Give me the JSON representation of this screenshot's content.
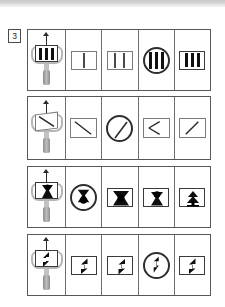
{
  "page": {
    "background_color": "#ffffff",
    "top_bar_color": "#d4d4d4",
    "ink_color": "#2a2a2c",
    "roller_color": "#b6b6b8"
  },
  "question": {
    "number": "3",
    "type": "visual-analogy-matrix",
    "row_count": 4,
    "cells_per_row": 5
  },
  "rows": [
    {
      "id": "row-1",
      "name": "vertical-bars-row",
      "stamp": {
        "name": "stamp-tool",
        "arrow": "up-arrow",
        "plate_glyph": "rect-with-3-vertical-bars",
        "bar_count": 3
      },
      "options": [
        {
          "label": "A",
          "glyph": "rect-with-1-vertical-bar",
          "shape": "rect",
          "bar_count": 1,
          "weight": "thin"
        },
        {
          "label": "B",
          "glyph": "rect-with-2-vertical-bars",
          "shape": "rect",
          "bar_count": 2,
          "weight": "thin"
        },
        {
          "label": "C",
          "glyph": "circle-with-3-vertical-bars",
          "shape": "circle",
          "bar_count": 3,
          "weight": "bold"
        },
        {
          "label": "D",
          "glyph": "rect-with-3-vertical-bars",
          "shape": "rect",
          "bar_count": 3,
          "weight": "bold"
        }
      ]
    },
    {
      "id": "row-2",
      "name": "diagonal-line-row",
      "stamp": {
        "name": "stamp-tool",
        "arrow": "up-arrow",
        "plate_glyph": "rect-with-backslash-diagonal",
        "diagonal": "backslash"
      },
      "options": [
        {
          "label": "A",
          "glyph": "rect-with-backslash-diagonal",
          "shape": "rect",
          "diagonal": "backslash"
        },
        {
          "label": "B",
          "glyph": "circle-with-slash-diagonal",
          "shape": "circle",
          "diagonal": "slash"
        },
        {
          "label": "C",
          "glyph": "rect-with-left-chevron",
          "shape": "rect",
          "diagonal": "chevron-left"
        },
        {
          "label": "D",
          "glyph": "rect-with-slash-diagonal",
          "shape": "rect",
          "diagonal": "slash"
        }
      ]
    },
    {
      "id": "row-3",
      "name": "hourglass-row",
      "stamp": {
        "name": "stamp-tool",
        "arrow": "up-arrow",
        "plate_glyph": "rect-with-hourglass"
      },
      "options": [
        {
          "label": "A",
          "glyph": "circle-with-hourglass",
          "shape": "circle"
        },
        {
          "label": "B",
          "glyph": "rect-with-horizontal-bowtie",
          "shape": "rect"
        },
        {
          "label": "C",
          "glyph": "rect-with-hourglass",
          "shape": "rect"
        },
        {
          "label": "D",
          "glyph": "rect-with-double-triangle-tree",
          "shape": "rect"
        }
      ]
    },
    {
      "id": "row-4",
      "name": "zigzag-arrow-row",
      "stamp": {
        "name": "stamp-tool",
        "arrow": "up-arrow",
        "plate_glyph": "rect-with-zigzag-up-arrow"
      },
      "options": [
        {
          "label": "A",
          "glyph": "rect-with-zigzag-up-arrow",
          "shape": "rect"
        },
        {
          "label": "B",
          "glyph": "rect-with-zigzag-down-arrow",
          "shape": "rect"
        },
        {
          "label": "C",
          "glyph": "circle-with-zigzag-down-arrow",
          "shape": "circle"
        },
        {
          "label": "D",
          "glyph": "rect-with-zigzag-up-arrow",
          "shape": "rect"
        }
      ]
    }
  ]
}
